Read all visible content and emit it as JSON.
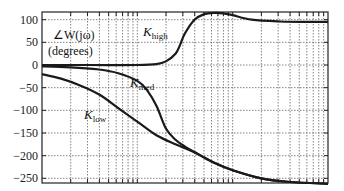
{
  "chart_data": {
    "type": "line",
    "title": "",
    "xlabel": "",
    "ylabel": "∠W(jω) (degrees)",
    "ylabel_lines": [
      "∠W(jω)",
      "(degrees)"
    ],
    "x_scale": "log",
    "x_decades": 3,
    "x_tick_labels": [],
    "ylim": [
      -260,
      117
    ],
    "y_ticks": [
      100,
      50,
      0,
      -50,
      -100,
      -150,
      -200,
      -250
    ],
    "y_tick_labels": [
      "100",
      "50",
      "0",
      "−50",
      "−100",
      "−150",
      "−200",
      "−250"
    ],
    "grid": true,
    "legend": "inline annotations",
    "x_units": "decades from left edge (log10 ω offset)",
    "series": [
      {
        "name": "K_high",
        "label_main": "K",
        "label_sub": "high",
        "label_pos": [
          143,
          36
        ],
        "x": [
          0.0,
          0.5,
          1.0,
          1.2,
          1.3,
          1.4,
          1.45,
          1.5,
          1.6,
          1.7,
          1.8,
          1.9,
          2.0,
          2.2,
          2.5,
          2.8,
          3.0
        ],
        "y": [
          0,
          0,
          0,
          2,
          8,
          25,
          45,
          70,
          100,
          112,
          115,
          114,
          110,
          100,
          96,
          95,
          95
        ]
      },
      {
        "name": "K_med",
        "label_main": "K",
        "label_sub": "med",
        "label_pos": [
          130,
          87
        ],
        "x": [
          0.0,
          0.3,
          0.6,
          0.8,
          1.0,
          1.1,
          1.2,
          1.3,
          1.4,
          1.5,
          1.6,
          1.8,
          2.0,
          2.3,
          2.6,
          3.0
        ],
        "y": [
          -3,
          -5,
          -10,
          -18,
          -35,
          -55,
          -90,
          -140,
          -165,
          -180,
          -192,
          -215,
          -232,
          -250,
          -258,
          -262
        ]
      },
      {
        "name": "K_low",
        "label_main": "K",
        "label_sub": "low",
        "label_pos": [
          84,
          119
        ],
        "x": [
          0.0,
          0.2,
          0.4,
          0.6,
          0.8,
          1.0,
          1.2,
          1.4,
          1.6,
          1.8,
          2.0,
          2.3,
          2.6,
          3.0
        ],
        "y": [
          -20,
          -30,
          -45,
          -65,
          -95,
          -125,
          -155,
          -175,
          -193,
          -215,
          -232,
          -250,
          -258,
          -262
        ]
      }
    ]
  }
}
